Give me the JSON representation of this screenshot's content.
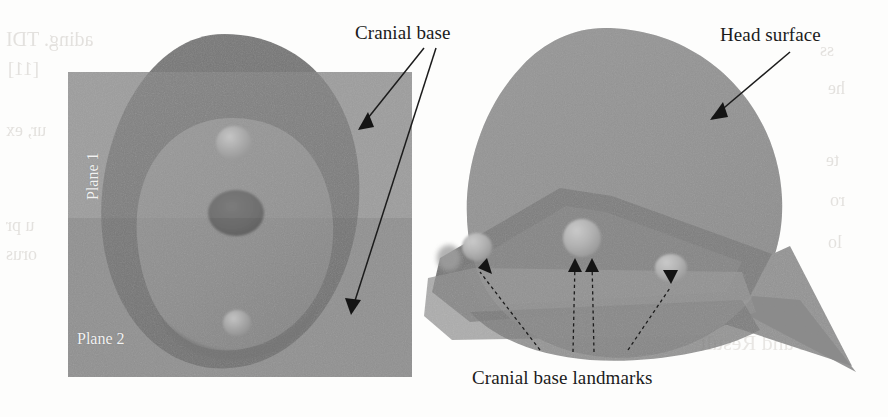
{
  "figure": {
    "kind": "3d-head-model-illustration",
    "background_color": "#fdfdfc",
    "annotations": {
      "cranial_base": "Cranial base",
      "head_surface": "Head surface",
      "cranial_base_landmarks": "Cranial base landmarks"
    },
    "left_panel": {
      "view": "top-down-axial",
      "plane_labels": {
        "plane1": "Plane 1",
        "plane2": "Plane 2"
      },
      "colors": {
        "plane1": "#919191",
        "plane2": "#8a8a8a",
        "head_outer": "#6f6f6f",
        "cranial_base": "#898989",
        "foramen": "#5d5d5d",
        "landmark": "#a4a4a4"
      }
    },
    "right_panel": {
      "view": "oblique-lateral",
      "colors": {
        "head_surface": "#8b8b8b",
        "cranial_base": "#6d6d6d",
        "cut_plane": "#7d7d7d",
        "plane_wedge": "#939393",
        "landmark": "#b0b0b0"
      },
      "landmark_count": 4
    },
    "ink_color": "#1b1b1b",
    "bleed_through": [
      "ading. TDI",
      "[11]",
      "ur, ex",
      "u pr",
      "orus",
      "ss",
      "he",
      "te",
      "ro",
      "lo",
      "sion and Result"
    ]
  }
}
